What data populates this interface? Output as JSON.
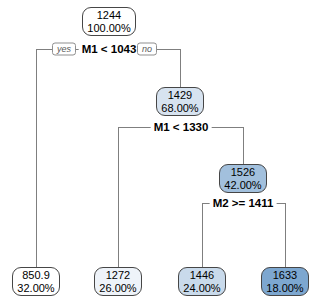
{
  "colors": {
    "background": "#ffffff",
    "node_border": "#464646",
    "branch_line": "#7f7f7f",
    "fill_scale_low": "#ffffff",
    "fill_scale_high": "#7da7d0"
  },
  "tree": {
    "type": "decision-tree",
    "edge_labels": {
      "yes": "yes",
      "no": "no"
    },
    "splits": {
      "s1": {
        "label": "M1 < 1043"
      },
      "s2": {
        "label": "M1 < 1330"
      },
      "s3": {
        "label": "M2 >= 1411"
      }
    },
    "nodes": {
      "root": {
        "value": "1244",
        "percent": "100.00%",
        "fill": "#ffffff"
      },
      "n68": {
        "value": "1429",
        "percent": "68.00%",
        "fill": "#d7e3f0"
      },
      "n42": {
        "value": "1526",
        "percent": "42.00%",
        "fill": "#a2c0dd"
      },
      "l32": {
        "value": "850.9",
        "percent": "32.00%",
        "fill": "#ffffff"
      },
      "l26": {
        "value": "1272",
        "percent": "26.00%",
        "fill": "#eef3f9"
      },
      "l24": {
        "value": "1446",
        "percent": "24.00%",
        "fill": "#c9daeb"
      },
      "l18": {
        "value": "1633",
        "percent": "18.00%",
        "fill": "#7da7d0"
      }
    }
  }
}
